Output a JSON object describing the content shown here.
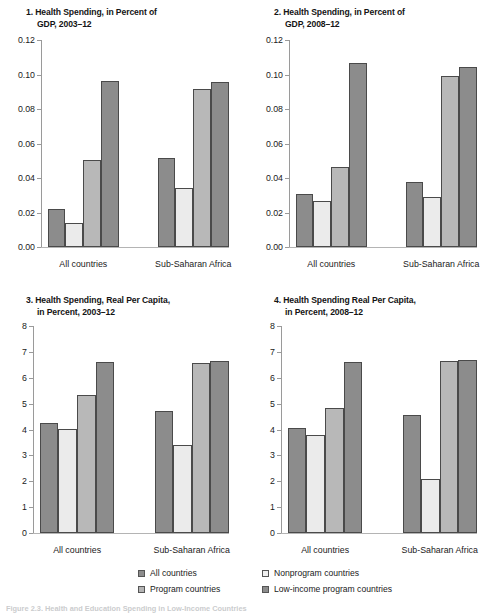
{
  "figure": {
    "caption_partial": "Figure 2.3.  Health and Education Spending in Low-Income Countries",
    "series_colors": {
      "all_countries": "#8c8c8c",
      "nonprogram_countries": "#dcdcdc",
      "program_countries": "#b4b4b4",
      "low_income_program_countries": "#8c8c8c"
    }
  },
  "legend": {
    "items": [
      {
        "label": "All countries",
        "key": "all_countries",
        "color": "#8c8c8c"
      },
      {
        "label": "Nonprogram countries",
        "key": "nonprogram_countries",
        "color": "#f0f0f0"
      },
      {
        "label": "Program countries",
        "key": "program_countries",
        "color": "#b4b4b4"
      },
      {
        "label": "Low-income program countries",
        "key": "low_income_program_countries",
        "color": "#8c8c8c"
      }
    ]
  },
  "chart_data": [
    {
      "id": "panel1",
      "type": "bar",
      "number": "1.",
      "title": "Health Spending, in Percent of GDP, 2003–12",
      "title_line1": "1. Health Spending, in Percent of",
      "title_line2": "GDP, 2003–12",
      "categories": [
        "All countries",
        "Sub-Saharan Africa"
      ],
      "series": [
        {
          "name": "All countries",
          "values": [
            0.0223,
            0.0515
          ]
        },
        {
          "name": "Nonprogram countries",
          "values": [
            0.0139,
            0.0344
          ]
        },
        {
          "name": "Program countries",
          "values": [
            0.0503,
            0.0915
          ]
        },
        {
          "name": "Low-income program countries",
          "values": [
            0.096,
            0.0958
          ]
        }
      ],
      "ylim": [
        0.0,
        0.12
      ],
      "yticks": [
        "0.00",
        "0.02",
        "0.04",
        "0.06",
        "0.08",
        "0.10",
        "0.12"
      ],
      "ytick_values": [
        0.0,
        0.02,
        0.04,
        0.06,
        0.08,
        0.1,
        0.12
      ],
      "xlabel": "",
      "ylabel": "",
      "grid": false
    },
    {
      "id": "panel2",
      "type": "bar",
      "number": "2.",
      "title": "Health Spending, in Percent of GDP, 2008–12",
      "title_line1": "2. Health Spending, in Percent of",
      "title_line2": "GDP, 2008–12",
      "categories": [
        "All countries",
        "Sub-Saharan Africa"
      ],
      "series": [
        {
          "name": "All countries",
          "values": [
            0.031,
            0.0377
          ]
        },
        {
          "name": "Nonprogram countries",
          "values": [
            0.0268,
            0.0288
          ]
        },
        {
          "name": "Program countries",
          "values": [
            0.0466,
            0.0993
          ]
        },
        {
          "name": "Low-income program countries",
          "values": [
            0.1065,
            0.1046
          ]
        }
      ],
      "ylim": [
        0.0,
        0.12
      ],
      "yticks": [
        "0.00",
        "0.02",
        "0.04",
        "0.06",
        "0.08",
        "0.10",
        "0.12"
      ],
      "ytick_values": [
        0.0,
        0.02,
        0.04,
        0.06,
        0.08,
        0.1,
        0.12
      ],
      "xlabel": "",
      "ylabel": "",
      "grid": false
    },
    {
      "id": "panel3",
      "type": "bar",
      "number": "3.",
      "title": "Health Spending, Real Per Capita, in Percent, 2003–12",
      "title_line1": "3. Health Spending, Real Per Capita,",
      "title_line2": "in Percent, 2003–12",
      "categories": [
        "All countries",
        "Sub-Saharan Africa"
      ],
      "series": [
        {
          "name": "All countries",
          "values": [
            4.27,
            4.7
          ]
        },
        {
          "name": "Nonprogram countries",
          "values": [
            4.03,
            3.42
          ]
        },
        {
          "name": "Program countries",
          "values": [
            5.33,
            6.58
          ]
        },
        {
          "name": "Low-income program countries",
          "values": [
            6.62,
            6.64
          ]
        }
      ],
      "ylim": [
        0,
        8
      ],
      "yticks": [
        "0",
        "1",
        "2",
        "3",
        "4",
        "5",
        "6",
        "7",
        "8"
      ],
      "ytick_values": [
        0,
        1,
        2,
        3,
        4,
        5,
        6,
        7,
        8
      ],
      "xlabel": "",
      "ylabel": "",
      "grid": false
    },
    {
      "id": "panel4",
      "type": "bar",
      "number": "4.",
      "title": "Health Spending Real Per Capita, in Percent, 2008–12",
      "title_line1": "4. Health Spending Real Per Capita,",
      "title_line2": "in Percent, 2008–12",
      "categories": [
        "All countries",
        "Sub-Saharan Africa"
      ],
      "series": [
        {
          "name": "All countries",
          "values": [
            4.04,
            4.56
          ]
        },
        {
          "name": "Nonprogram countries",
          "values": [
            3.79,
            2.09
          ]
        },
        {
          "name": "Program countries",
          "values": [
            4.83,
            6.65
          ]
        },
        {
          "name": "Low-income program countries",
          "values": [
            6.6,
            6.67
          ]
        }
      ],
      "ylim": [
        0,
        8
      ],
      "yticks": [
        "0",
        "1",
        "2",
        "3",
        "4",
        "5",
        "6",
        "7",
        "8"
      ],
      "ytick_values": [
        0,
        1,
        2,
        3,
        4,
        5,
        6,
        7,
        8
      ],
      "xlabel": "",
      "ylabel": "",
      "grid": false
    }
  ]
}
